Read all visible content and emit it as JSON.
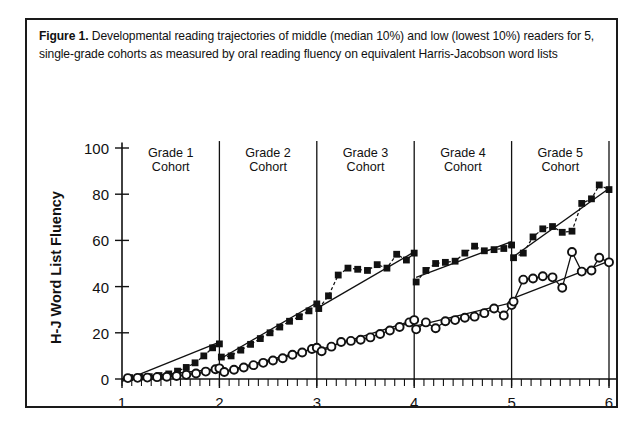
{
  "caption": {
    "figure_label": "Figure 1.",
    "text": " Developmental reading trajectories of middle (median 10%) and low (lowest 10%) readers for 5, single-grade cohorts as measured by oral reading fluency on equivalent Harris-Jacobson word lists"
  },
  "chart_data": {
    "type": "scatter",
    "title": "Developmental reading trajectories of middle (median 10%) and low (lowest 10%) readers for 5, single-grade cohorts as measured by oral reading fluency on equivalent Harris-Jacobson word lists",
    "xlabel": "Grade",
    "ylabel": "H-J Word List Fluency",
    "xlim": [
      1,
      6.2
    ],
    "ylim": [
      0,
      105
    ],
    "xticks": [
      1,
      2,
      3,
      4,
      5,
      6
    ],
    "xticklabels": [
      "1",
      "2",
      "3",
      "4",
      "5",
      "6"
    ],
    "yticks": [
      0,
      20,
      40,
      60,
      80,
      100
    ],
    "yticklabels": [
      "0",
      "20",
      "40",
      "60",
      "80",
      "100"
    ],
    "grid": false,
    "legend": "none",
    "minor_ticks_per_unit": 10,
    "panel_separators": [
      2,
      3,
      4,
      5,
      6
    ],
    "cohort_labels": [
      {
        "label_line1": "Grade 1",
        "label_line2": "Cohort",
        "x_center": 1.5
      },
      {
        "label_line1": "Grade 2",
        "label_line2": "Cohort",
        "x_center": 2.5
      },
      {
        "label_line1": "Grade 3",
        "label_line2": "Cohort",
        "x_center": 3.5
      },
      {
        "label_line1": "Grade 4",
        "label_line2": "Cohort",
        "x_center": 4.5
      },
      {
        "label_line1": "Grade 5",
        "label_line2": "Cohort",
        "x_center": 5.5
      }
    ],
    "series": [
      {
        "name": "middle readers (median 10%)",
        "marker": "filled-square",
        "points": [
          [
            1.08,
            0.6
          ],
          [
            1.18,
            0.8
          ],
          [
            1.28,
            1.0
          ],
          [
            1.38,
            1.5
          ],
          [
            1.48,
            2.2
          ],
          [
            1.57,
            3.4
          ],
          [
            1.66,
            5.0
          ],
          [
            1.75,
            7.0
          ],
          [
            1.84,
            10.0
          ],
          [
            1.93,
            13.5
          ],
          [
            2.0,
            15.2
          ],
          [
            2.02,
            9.5
          ],
          [
            2.12,
            10.0
          ],
          [
            2.22,
            12.5
          ],
          [
            2.32,
            15.0
          ],
          [
            2.42,
            17.5
          ],
          [
            2.52,
            20.0
          ],
          [
            2.62,
            22.5
          ],
          [
            2.72,
            25.0
          ],
          [
            2.82,
            27.0
          ],
          [
            2.92,
            29.5
          ],
          [
            3.0,
            32.5
          ],
          [
            3.02,
            30.5
          ],
          [
            3.12,
            36.0
          ],
          [
            3.22,
            45.0
          ],
          [
            3.32,
            48.0
          ],
          [
            3.42,
            47.5
          ],
          [
            3.52,
            47.0
          ],
          [
            3.62,
            49.5
          ],
          [
            3.72,
            48.0
          ],
          [
            3.82,
            54.0
          ],
          [
            3.92,
            51.5
          ],
          [
            4.0,
            54.5
          ],
          [
            4.02,
            42.0
          ],
          [
            4.12,
            47.0
          ],
          [
            4.22,
            50.0
          ],
          [
            4.32,
            50.5
          ],
          [
            4.42,
            51.0
          ],
          [
            4.52,
            54.5
          ],
          [
            4.62,
            57.5
          ],
          [
            4.72,
            55.5
          ],
          [
            4.82,
            56.0
          ],
          [
            4.92,
            56.5
          ],
          [
            5.0,
            58.0
          ],
          [
            5.02,
            52.5
          ],
          [
            5.12,
            54.5
          ],
          [
            5.22,
            61.5
          ],
          [
            5.32,
            65.0
          ],
          [
            5.42,
            66.0
          ],
          [
            5.52,
            63.5
          ],
          [
            5.62,
            64.0
          ],
          [
            5.72,
            76.0
          ],
          [
            5.82,
            78.0
          ],
          [
            5.9,
            84.0
          ],
          [
            6.0,
            82.0
          ]
        ]
      },
      {
        "name": "low readers (lowest 10%)",
        "marker": "open-circle",
        "points": [
          [
            1.06,
            0.4
          ],
          [
            1.16,
            0.5
          ],
          [
            1.26,
            0.6
          ],
          [
            1.36,
            0.8
          ],
          [
            1.46,
            1.0
          ],
          [
            1.56,
            1.3
          ],
          [
            1.66,
            1.8
          ],
          [
            1.76,
            2.4
          ],
          [
            1.86,
            3.2
          ],
          [
            1.96,
            4.2
          ],
          [
            2.0,
            4.6
          ],
          [
            2.05,
            3.0
          ],
          [
            2.15,
            4.0
          ],
          [
            2.25,
            5.0
          ],
          [
            2.35,
            6.0
          ],
          [
            2.45,
            7.0
          ],
          [
            2.55,
            8.0
          ],
          [
            2.65,
            9.0
          ],
          [
            2.75,
            10.5
          ],
          [
            2.85,
            11.5
          ],
          [
            2.95,
            13.0
          ],
          [
            3.0,
            13.5
          ],
          [
            3.05,
            12.0
          ],
          [
            3.15,
            14.0
          ],
          [
            3.25,
            16.0
          ],
          [
            3.35,
            16.5
          ],
          [
            3.45,
            17.0
          ],
          [
            3.55,
            18.0
          ],
          [
            3.65,
            19.5
          ],
          [
            3.75,
            21.0
          ],
          [
            3.85,
            22.5
          ],
          [
            3.95,
            24.5
          ],
          [
            4.0,
            25.5
          ],
          [
            4.02,
            21.5
          ],
          [
            4.12,
            24.5
          ],
          [
            4.22,
            22.0
          ],
          [
            4.32,
            25.0
          ],
          [
            4.42,
            25.5
          ],
          [
            4.52,
            26.5
          ],
          [
            4.62,
            27.0
          ],
          [
            4.72,
            28.5
          ],
          [
            4.82,
            30.5
          ],
          [
            4.92,
            27.5
          ],
          [
            5.0,
            32.0
          ],
          [
            5.02,
            33.5
          ],
          [
            5.12,
            43.0
          ],
          [
            5.22,
            43.5
          ],
          [
            5.32,
            44.5
          ],
          [
            5.42,
            44.0
          ],
          [
            5.52,
            39.5
          ],
          [
            5.62,
            55.0
          ],
          [
            5.72,
            46.5
          ],
          [
            5.82,
            47.0
          ],
          [
            5.9,
            52.5
          ],
          [
            6.0,
            50.5
          ]
        ]
      }
    ],
    "trend_lines": [
      {
        "series": "middle",
        "x0": 1.0,
        "y0": -1.0,
        "x1": 2.0,
        "y1": 16.0
      },
      {
        "series": "middle",
        "x0": 2.02,
        "y0": 9.0,
        "x1": 3.0,
        "y1": 33.0
      },
      {
        "series": "middle",
        "x0": 3.02,
        "y0": 31.0,
        "x1": 4.0,
        "y1": 55.0
      },
      {
        "series": "middle",
        "x0": 4.02,
        "y0": 44.0,
        "x1": 5.0,
        "y1": 59.5
      },
      {
        "series": "middle",
        "x0": 5.02,
        "y0": 53.0,
        "x1": 6.0,
        "y1": 82.5
      },
      {
        "series": "low",
        "x0": 1.0,
        "y0": 0.0,
        "x1": 2.0,
        "y1": 4.5
      },
      {
        "series": "low",
        "x0": 2.02,
        "y0": 3.0,
        "x1": 3.0,
        "y1": 13.5
      },
      {
        "series": "low",
        "x0": 3.02,
        "y0": 12.5,
        "x1": 4.0,
        "y1": 25.5
      },
      {
        "series": "low",
        "x0": 4.02,
        "y0": 23.0,
        "x1": 5.0,
        "y1": 33.0
      },
      {
        "series": "low",
        "x0": 5.02,
        "y0": 35.0,
        "x1": 6.0,
        "y1": 51.0
      }
    ]
  }
}
